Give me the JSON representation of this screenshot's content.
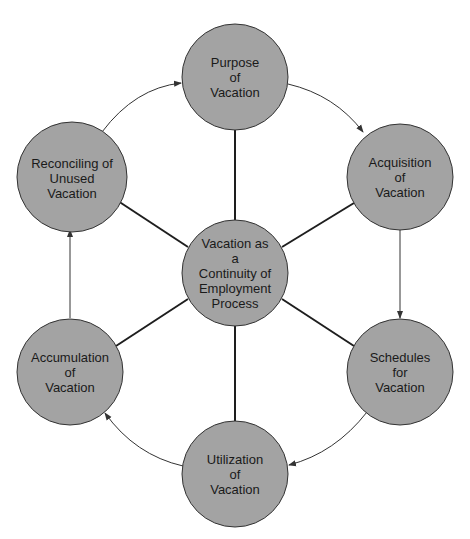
{
  "diagram": {
    "title": "",
    "colors": {
      "node_fill": "#a3a3a3",
      "node_stroke": "#333333",
      "spoke": "#1e1e1e",
      "arrow": "#333333",
      "background": "#ffffff"
    },
    "center": {
      "id": "center",
      "lines": [
        "Vacation as",
        "a",
        "Continuity of",
        "Employment",
        "Process"
      ]
    },
    "nodes": [
      {
        "id": "purpose",
        "lines": [
          "Purpose",
          "of",
          "Vacation"
        ]
      },
      {
        "id": "acquisition",
        "lines": [
          "Acquisition",
          "of",
          "Vacation"
        ]
      },
      {
        "id": "schedules",
        "lines": [
          "Schedules",
          "for",
          "Vacation"
        ]
      },
      {
        "id": "utilization",
        "lines": [
          "Utilization",
          "of",
          "Vacation"
        ]
      },
      {
        "id": "accumulation",
        "lines": [
          "Accumulation",
          "of",
          "Vacation"
        ]
      },
      {
        "id": "reconciling",
        "lines": [
          "Reconciling of",
          "Unused",
          "Vacation"
        ]
      }
    ],
    "flow": [
      {
        "from": "reconciling",
        "to": "purpose",
        "style": "curved-arrow"
      },
      {
        "from": "purpose",
        "to": "acquisition",
        "style": "curved-arrow"
      },
      {
        "from": "acquisition",
        "to": "schedules",
        "style": "straight-arrow"
      },
      {
        "from": "schedules",
        "to": "utilization",
        "style": "curved-arrow"
      },
      {
        "from": "utilization",
        "to": "accumulation",
        "style": "curved-arrow"
      },
      {
        "from": "accumulation",
        "to": "reconciling",
        "style": "straight-arrow"
      }
    ],
    "spokes": [
      "purpose",
      "acquisition",
      "schedules",
      "utilization",
      "accumulation",
      "reconciling"
    ]
  }
}
